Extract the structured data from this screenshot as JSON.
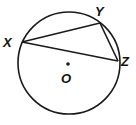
{
  "diagram": {
    "type": "inscribed-triangle-in-circle",
    "stroke_color": "#1a1a1a",
    "background": "#ffffff",
    "circle": {
      "cx": 69,
      "cy": 63,
      "r": 51
    },
    "center": {
      "label": "O",
      "x": 68,
      "y": 64,
      "label_x": 61,
      "label_y": 83
    },
    "points": [
      {
        "label": "X",
        "x": 22,
        "y": 42,
        "label_x": 3,
        "label_y": 47
      },
      {
        "label": "Y",
        "x": 100,
        "y": 23,
        "label_x": 95,
        "label_y": 16
      },
      {
        "label": "Z",
        "x": 118,
        "y": 61,
        "label_x": 121,
        "label_y": 66
      }
    ],
    "segments": [
      {
        "from": "X",
        "to": "Y"
      },
      {
        "from": "Y",
        "to": "Z"
      },
      {
        "from": "X",
        "to": "Z"
      }
    ]
  }
}
